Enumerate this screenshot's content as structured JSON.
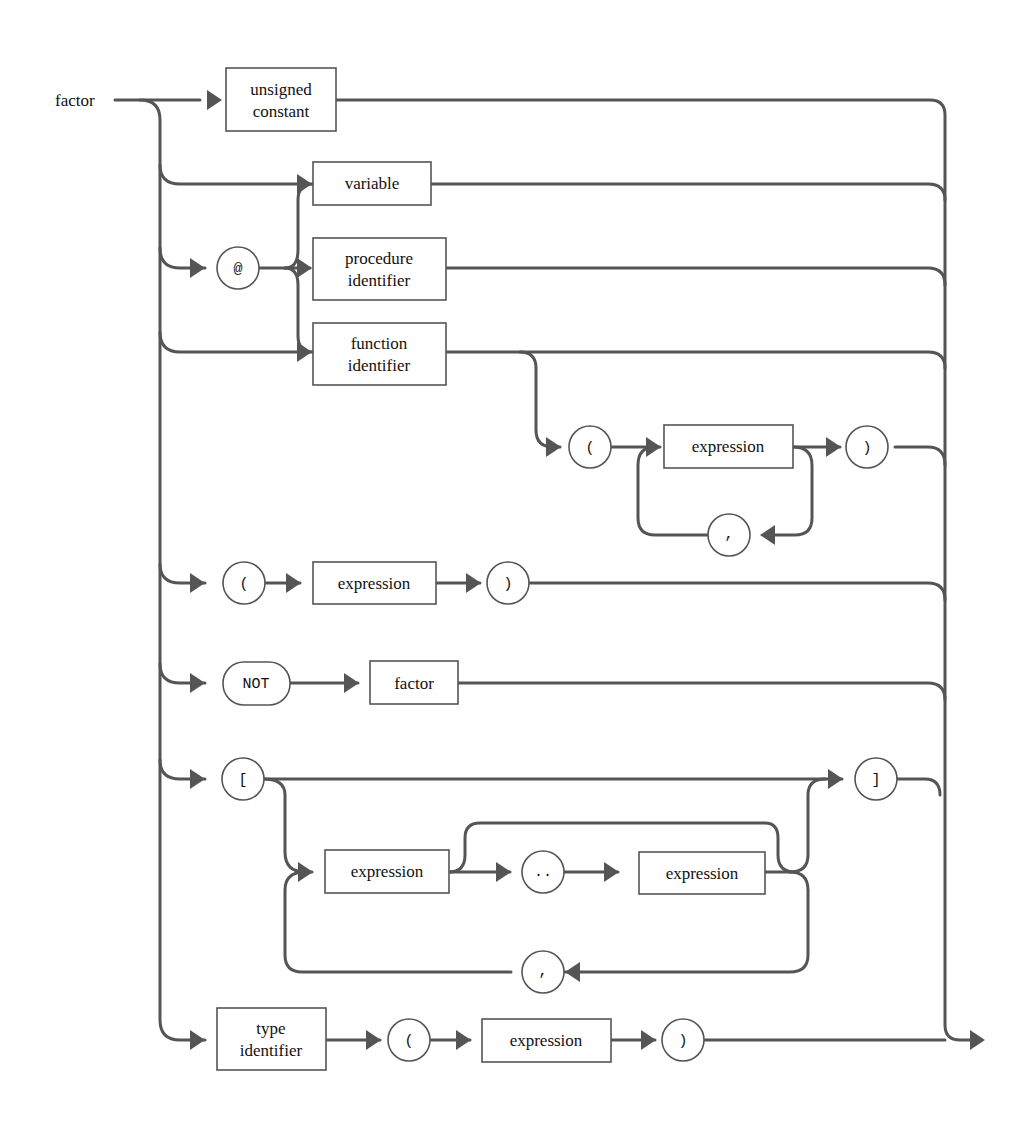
{
  "diagram": {
    "title": "factor",
    "colors": {
      "line": "#555555",
      "text": "#111111",
      "background": "#ffffff"
    },
    "nonterminals": {
      "unsigned_constant": [
        "unsigned",
        "constant"
      ],
      "variable": "variable",
      "procedure_identifier": [
        "procedure",
        "identifier"
      ],
      "function_identifier": [
        "function",
        "identifier"
      ],
      "func_expression": "expression",
      "paren_expression": "expression",
      "not_factor": "factor",
      "set_expression_1": "expression",
      "set_expression_2": "expression",
      "type_identifier": [
        "type",
        "identifier"
      ],
      "cast_expression": "expression"
    },
    "terminals": {
      "at": "@",
      "func_lparen": "(",
      "func_rparen": ")",
      "func_comma": ",",
      "lparen": "(",
      "rparen": ")",
      "not": "NOT",
      "lbracket": "[",
      "rbracket": "]",
      "range": "..",
      "set_comma": ",",
      "cast_lparen": "(",
      "cast_rparen": ")"
    }
  }
}
